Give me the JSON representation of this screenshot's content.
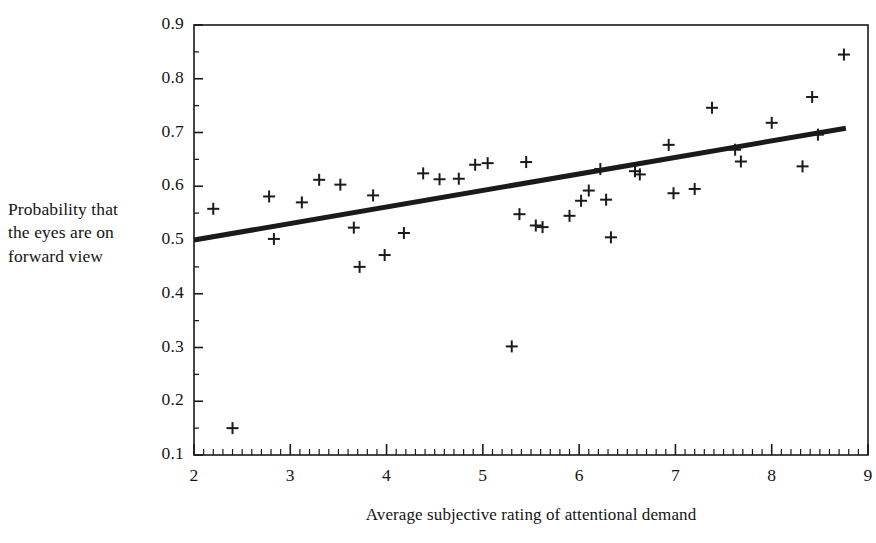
{
  "chart_data": {
    "type": "scatter",
    "title": "",
    "xlabel": "Average subjective rating of attentional demand",
    "ylabel": "Probability that the eyes are on forward view",
    "ylabel_lines": [
      "Probability that",
      "the eyes are on",
      "forward view"
    ],
    "xlim": [
      2,
      9
    ],
    "ylim": [
      0.1,
      0.9
    ],
    "xticks": [
      2,
      3,
      4,
      5,
      6,
      7,
      8,
      9
    ],
    "xtick_labels": [
      "2",
      "3",
      "4",
      "5",
      "6",
      "7",
      "8",
      "9"
    ],
    "yticks": [
      0.1,
      0.2,
      0.3,
      0.4,
      0.5,
      0.6,
      0.7,
      0.8,
      0.9
    ],
    "ytick_labels": [
      "0.1",
      "0.2",
      "0.3",
      "0.4",
      "0.5",
      "0.6",
      "0.7",
      "0.8",
      "0.9"
    ],
    "x_minor_tick_step": 0.1,
    "y_minor_tick_step": 0.05,
    "grid": false,
    "legend": false,
    "frame": "box",
    "marker": "plus",
    "marker_color": "#1a1a1a",
    "line_color": "#1a1a1a",
    "background_color": "#ffffff",
    "points": [
      {
        "x": 2.2,
        "y": 0.558
      },
      {
        "x": 2.4,
        "y": 0.15
      },
      {
        "x": 2.78,
        "y": 0.581
      },
      {
        "x": 2.83,
        "y": 0.502
      },
      {
        "x": 3.12,
        "y": 0.57
      },
      {
        "x": 3.3,
        "y": 0.612
      },
      {
        "x": 3.52,
        "y": 0.603
      },
      {
        "x": 3.66,
        "y": 0.523
      },
      {
        "x": 3.72,
        "y": 0.45
      },
      {
        "x": 3.86,
        "y": 0.583
      },
      {
        "x": 3.98,
        "y": 0.472
      },
      {
        "x": 4.18,
        "y": 0.513
      },
      {
        "x": 4.38,
        "y": 0.624
      },
      {
        "x": 4.55,
        "y": 0.613
      },
      {
        "x": 4.75,
        "y": 0.614
      },
      {
        "x": 4.92,
        "y": 0.64
      },
      {
        "x": 5.05,
        "y": 0.643
      },
      {
        "x": 5.3,
        "y": 0.302
      },
      {
        "x": 5.38,
        "y": 0.548
      },
      {
        "x": 5.45,
        "y": 0.645
      },
      {
        "x": 5.55,
        "y": 0.527
      },
      {
        "x": 5.62,
        "y": 0.524
      },
      {
        "x": 5.9,
        "y": 0.545
      },
      {
        "x": 6.02,
        "y": 0.573
      },
      {
        "x": 6.1,
        "y": 0.592
      },
      {
        "x": 6.22,
        "y": 0.632
      },
      {
        "x": 6.28,
        "y": 0.575
      },
      {
        "x": 6.33,
        "y": 0.505
      },
      {
        "x": 6.58,
        "y": 0.628
      },
      {
        "x": 6.63,
        "y": 0.622
      },
      {
        "x": 6.93,
        "y": 0.677
      },
      {
        "x": 6.98,
        "y": 0.587
      },
      {
        "x": 7.2,
        "y": 0.595
      },
      {
        "x": 7.38,
        "y": 0.746
      },
      {
        "x": 7.62,
        "y": 0.668
      },
      {
        "x": 7.68,
        "y": 0.646
      },
      {
        "x": 8.0,
        "y": 0.718
      },
      {
        "x": 8.32,
        "y": 0.637
      },
      {
        "x": 8.42,
        "y": 0.766
      },
      {
        "x": 8.48,
        "y": 0.696
      },
      {
        "x": 8.75,
        "y": 0.845
      }
    ],
    "trendline": {
      "type": "line",
      "x_start": 2.0,
      "y_start": 0.5,
      "x_end": 8.77,
      "y_end": 0.708,
      "slope": 0.0307,
      "intercept": 0.4386,
      "width_px": 5
    }
  }
}
